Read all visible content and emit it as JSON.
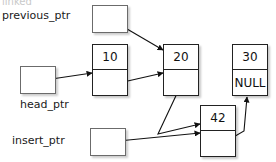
{
  "figure": {
    "title_clipped": "linked",
    "background": "#ffffff",
    "stroke_color": "#222222",
    "text_color": "#111111",
    "width": 276,
    "height": 162
  },
  "pointers": [
    {
      "id": "previous_ptr",
      "label": "previous_ptr",
      "label_x": 2,
      "label_y": 9,
      "box_x": 92,
      "box_y": 5,
      "box_w": 36,
      "box_h": 28
    },
    {
      "id": "head_ptr",
      "label": "head_ptr",
      "label_x": 20,
      "label_y": 98,
      "box_x": 20,
      "box_y": 66,
      "box_w": 36,
      "box_h": 28
    },
    {
      "id": "insert_ptr",
      "label": "insert_ptr",
      "label_x": 12,
      "label_y": 134,
      "box_x": 90,
      "box_y": 128,
      "box_w": 36,
      "box_h": 28
    }
  ],
  "nodes": [
    {
      "id": "node-10",
      "value": "10",
      "next": "",
      "x": 92,
      "y": 44,
      "w": 36,
      "h": 52
    },
    {
      "id": "node-20",
      "value": "20",
      "next": "",
      "x": 163,
      "y": 44,
      "w": 36,
      "h": 52
    },
    {
      "id": "node-30",
      "value": "30",
      "next": "NULL",
      "x": 232,
      "y": 44,
      "w": 36,
      "h": 52
    },
    {
      "id": "node-42",
      "value": "42",
      "next": "",
      "x": 200,
      "y": 105,
      "w": 36,
      "h": 52
    }
  ],
  "arrows": [
    {
      "id": "arrow-previous-ptr-to-node-20",
      "from": "previous_ptr",
      "to": "node-20",
      "path": "M 110,19 L 163,50"
    },
    {
      "id": "arrow-head-ptr-to-node-10",
      "from": "head_ptr",
      "to": "node-10",
      "path": "M 38,81 L 92,73"
    },
    {
      "id": "arrow-node-10-to-node-20",
      "from": "node-10",
      "to": "node-20",
      "path": "M 110,85 L 163,73"
    },
    {
      "id": "arrow-node-20-to-node-42",
      "from": "node-20",
      "to": "node-42",
      "path": "M 181,85 L 158,134 L 200,124"
    },
    {
      "id": "arrow-insert-ptr-to-node-42",
      "from": "insert_ptr",
      "to": "node-42",
      "path": "M 108,142 L 200,133"
    },
    {
      "id": "arrow-node-42-to-node-30",
      "from": "node-42",
      "to": "node-30",
      "path": "M 218,146 L 244,131 L 247,97"
    }
  ]
}
